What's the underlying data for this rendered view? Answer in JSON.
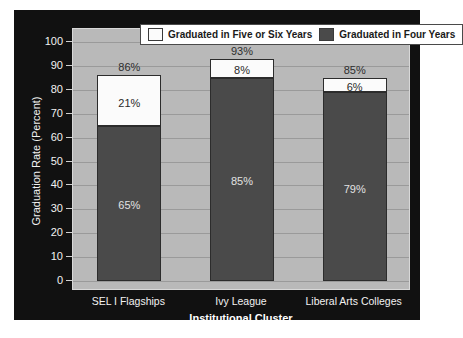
{
  "chart_data": {
    "type": "bar",
    "subtype": "stacked",
    "title": "",
    "xlabel": "Institutional Cluster",
    "ylabel": "Graduation Rate (Percent)",
    "categories": [
      "SEL I Flagships",
      "Ivy League",
      "Liberal Arts Colleges"
    ],
    "ylim": [
      0,
      100
    ],
    "yticks": [
      0,
      10,
      20,
      30,
      40,
      50,
      60,
      70,
      80,
      90,
      100
    ],
    "ytick_labels": [
      "0",
      "10",
      "20",
      "30",
      "40",
      "50",
      "60",
      "70",
      "80",
      "90",
      "100"
    ],
    "grid": true,
    "legend_position": "top-center",
    "series": [
      {
        "name": "Graduated in Four Years",
        "color": "#4a4a4a",
        "values": [
          65,
          85,
          79
        ],
        "value_labels": [
          "65%",
          "85%",
          "79%"
        ]
      },
      {
        "name": "Graduated in Five or Six Years",
        "color": "#fbfbfb",
        "values": [
          21,
          8,
          6
        ],
        "value_labels": [
          "21%",
          "8%",
          "6%"
        ]
      }
    ],
    "totals": [
      86,
      93,
      85
    ],
    "total_labels": [
      "86%",
      "93%",
      "85%"
    ]
  },
  "legend": {
    "entries": [
      {
        "label": "Graduated in Five or Six Years",
        "swatch": "#fbfbfb"
      },
      {
        "label": "Graduated in Four Years",
        "swatch": "#4a4a4a"
      }
    ]
  },
  "colors": {
    "panel_background": "#111111",
    "plot_background": "#b9b9b9",
    "gridline": "#9a9a9a",
    "four_year_bar": "#4a4a4a",
    "five_six_year_bar": "#fbfbfb",
    "axis_text": "#f2f2f2"
  }
}
